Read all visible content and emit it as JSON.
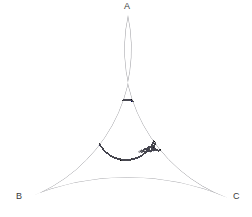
{
  "figure": {
    "name": "apollonian-gasket",
    "background_color": "#ffffff",
    "stroke_color": "#4a4a52",
    "label_color": "#3a3a3a",
    "stroke_width": 0.55,
    "canvas": {
      "width": 252,
      "height": 217
    }
  },
  "vertices": [
    {
      "id": "A",
      "label": "A",
      "cusp_x": 128,
      "cusp_y": 15,
      "label_x": 124,
      "label_y": 2
    },
    {
      "id": "B",
      "label": "B",
      "cusp_x": 27,
      "cusp_y": 198,
      "label_x": 16,
      "label_y": 192
    },
    {
      "id": "C",
      "label": "C",
      "cusp_x": 228,
      "cusp_y": 198,
      "label_x": 233,
      "label_y": 192
    }
  ],
  "chart_data": {
    "type": "diagram",
    "bounding_circles": [
      {
        "name": "arc-AB",
        "cx": -41.5,
        "cy": 44.9,
        "r": 158.6
      },
      {
        "name": "arc-AC",
        "cx": 296.5,
        "cy": 44.9,
        "r": 158.6
      },
      {
        "name": "arc-BC",
        "cx": 127.5,
        "cy": -48.5,
        "r": 257.0
      }
    ],
    "inner_circles": [
      {
        "name": "central-circle",
        "cx": 126,
        "cy": 130,
        "r": 30,
        "generation": 0
      },
      {
        "name": "circle-upper",
        "cx": 127,
        "cy": 78,
        "r": 13.5,
        "generation": 1
      },
      {
        "name": "circle-lower-left",
        "cx": 82,
        "cy": 155,
        "r": 13.5,
        "generation": 1
      },
      {
        "name": "circle-lower-right",
        "cx": 172,
        "cy": 155,
        "r": 13.5,
        "generation": 1
      }
    ],
    "depth": 7,
    "min_radius_px": 0.35,
    "xlabel": "",
    "ylabel": "",
    "grid": false,
    "legend": false
  }
}
